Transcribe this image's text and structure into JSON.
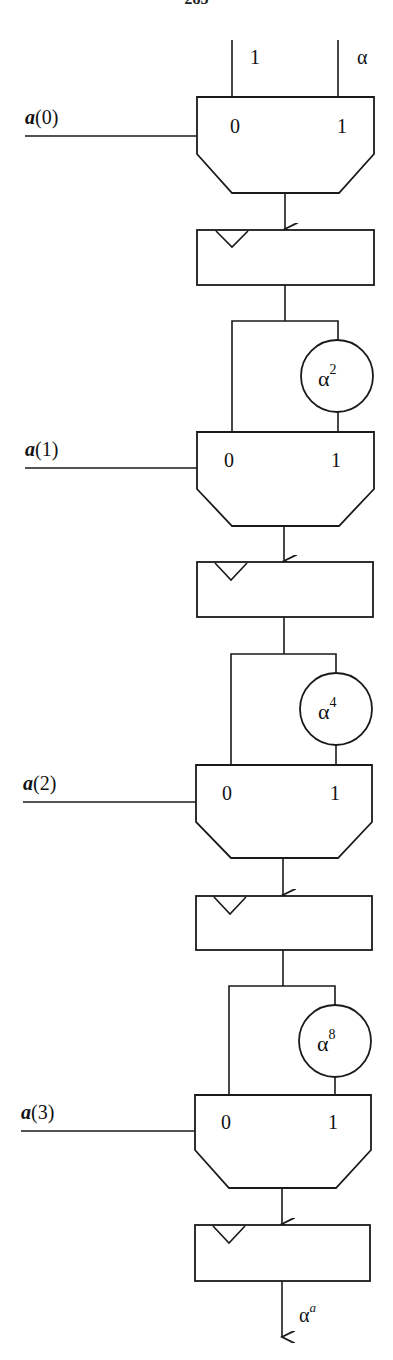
{
  "page": {
    "number": "283"
  },
  "inputs": {
    "top_left": "1",
    "top_right": "α"
  },
  "stages": [
    {
      "select_label": "a(0)",
      "sel_a": "a",
      "sel_idx": "(0)",
      "mux_in0": "0",
      "mux_in1": "1",
      "multiplier": null
    },
    {
      "select_label": "a(1)",
      "sel_a": "a",
      "sel_idx": "(1)",
      "mux_in0": "0",
      "mux_in1": "1",
      "multiplier": {
        "base": "α",
        "exp": "2"
      }
    },
    {
      "select_label": "a(2)",
      "sel_a": "a",
      "sel_idx": "(2)",
      "mux_in0": "0",
      "mux_in1": "1",
      "multiplier": {
        "base": "α",
        "exp": "4"
      }
    },
    {
      "select_label": "a(3)",
      "sel_a": "a",
      "sel_idx": "(3)",
      "mux_in0": "0",
      "mux_in1": "1",
      "multiplier": {
        "base": "α",
        "exp": "8"
      }
    }
  ],
  "output": {
    "base": "α",
    "exp": "a"
  }
}
